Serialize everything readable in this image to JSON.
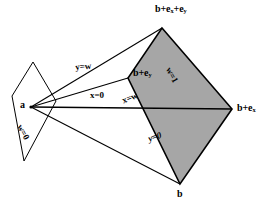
{
  "figure": {
    "background_color": "#ffffff",
    "stroke_color": "#000000",
    "shaded_fill_color": "#a6a6a6",
    "unshaded_fill_color": "#ffffff"
  },
  "vertices": {
    "apex": "a",
    "top": "b+e",
    "top_sub1": "x",
    "top_plus": "+e",
    "top_sub2": "y",
    "mid_left": "b+e",
    "mid_left_sub": "y",
    "right": "b+e",
    "right_sub": "x",
    "bottom": "b"
  },
  "labels": {
    "apex": "a",
    "top_vertex": "b+ex+ey",
    "mid_left_vertex": "b+ey",
    "right_vertex": "b+ex",
    "bottom_vertex": "b",
    "plane_w0": "w=0",
    "plane_w1": "w=1",
    "line_y_eq_w": "y=w",
    "line_x_eq_0": "x=0",
    "line_x_eq_w": "x=w",
    "line_y_eq_0": "y=0"
  },
  "geometry": {
    "apex_point": [
      31,
      107
    ],
    "near_quad": [
      [
        33,
        62
      ],
      [
        56,
        101
      ],
      [
        24,
        161
      ],
      [
        12,
        96
      ]
    ],
    "far_quad": [
      [
        162,
        28
      ],
      [
        232,
        109
      ],
      [
        180,
        184
      ],
      [
        128,
        78
      ]
    ],
    "rays": [
      [
        31,
        107,
        162,
        28
      ],
      [
        31,
        107,
        232,
        109
      ],
      [
        31,
        107,
        180,
        184
      ],
      [
        31,
        107,
        128,
        78
      ]
    ]
  }
}
